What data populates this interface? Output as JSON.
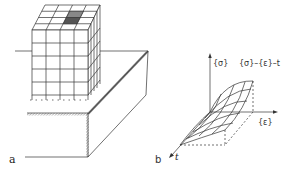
{
  "figure": {
    "panel_a": {
      "label": "a",
      "description": "Mesh block resting on a slab/foundation corner"
    },
    "panel_b": {
      "label": "b",
      "axes": {
        "vertical": "{σ}",
        "horizontal": "{ε}",
        "depth": "t"
      },
      "surface_label": "{σ}–{ε}–t"
    }
  },
  "colors": {
    "line": "#333333",
    "hatch": "#777777",
    "shaded_cell": "#555555",
    "background": "#ffffff"
  }
}
